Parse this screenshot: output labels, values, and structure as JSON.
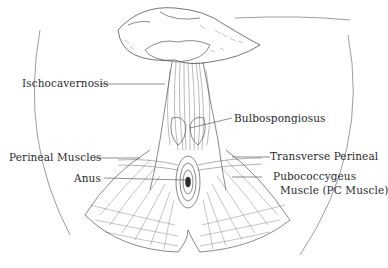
{
  "diagram": {
    "colors": {
      "ink": "#3a3a3a",
      "label": "#2a2a2a",
      "background": "#ffffff"
    },
    "labels": [
      {
        "id": "ischocavernosis",
        "text": "Ischocavernosis"
      },
      {
        "id": "bulbospongiosus",
        "text": "Bulbospongiosus"
      },
      {
        "id": "perineal-muscles",
        "text": "Perineal Muscles"
      },
      {
        "id": "transverse-perineal",
        "text": "Transverse Perineal"
      },
      {
        "id": "anus",
        "text": "Anus"
      },
      {
        "id": "pubococcygeus-line1",
        "text": "Pubococcygeus"
      },
      {
        "id": "pubococcygeus-line2",
        "text": "Muscle (PC Muscle)"
      }
    ]
  }
}
